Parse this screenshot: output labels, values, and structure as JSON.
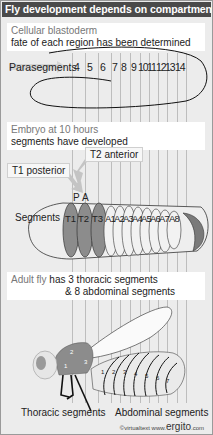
{
  "title": "Fly development depends on compartments",
  "panel1": {
    "heading": "Cellular blastoderm",
    "subheading": "fate of each region has been determined",
    "arrow_label": "Parasegments",
    "parasegments": [
      "4",
      "5",
      "6",
      "7",
      "8",
      "9",
      "10",
      "11",
      "12",
      "13",
      "14"
    ]
  },
  "panel2": {
    "heading": "Embryo at 10 hours",
    "subheading": "segments have developed",
    "tag_t2": "T2 anterior",
    "tag_t1": "T1 posterior",
    "p_label": "P",
    "a_label": "A",
    "segments_label": "Segments",
    "segments": [
      "T1",
      "T2",
      "T3",
      "A1",
      "A2",
      "A3",
      "A4",
      "A5",
      "A6",
      "A7",
      "A8"
    ]
  },
  "panel3": {
    "heading_grey": "Adult fly",
    "heading": "has 3 thoracic segments",
    "subheading": "& 8 abdominal segments",
    "thorax_numbers": [
      "1",
      "2",
      "3"
    ],
    "abdomen_numbers": [
      "1",
      "2",
      "3",
      "4",
      "5",
      "6",
      "7"
    ],
    "thoracic_label": "Thoracic segments",
    "abdominal_label": "Abdominal segments"
  },
  "credit": {
    "prefix": "©virtualtext  www.",
    "brand": "ergito",
    "suffix": ".com"
  },
  "colors": {
    "title_bar": "#4a4a4a",
    "thoracic": "#8c8c8c",
    "abdominal": "#eeeeee",
    "tail": "#7a7a7a"
  }
}
